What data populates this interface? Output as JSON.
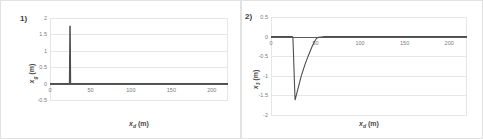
{
  "figure": {
    "panel_count": 2,
    "background": "#ffffff",
    "border_color": "#e2e2e2",
    "series_color": "#4d4d4d",
    "grid_color": "#e6e6e6"
  },
  "panels": [
    {
      "label": "1)",
      "name": "panel-1"
    },
    {
      "label": "2)",
      "name": "panel-2"
    }
  ],
  "chart_data": [
    {
      "type": "line",
      "title": "",
      "panel_label": "1)",
      "xlabel_var": "x",
      "xlabel_sub": "d",
      "xlabel_unit": "(m)",
      "ylabel_var": "x",
      "ylabel_sub": "g",
      "ylabel_unit": "(m)",
      "xlim": [
        0,
        220
      ],
      "ylim": [
        -0.5,
        2
      ],
      "xticks": [
        0,
        50,
        100,
        150,
        200
      ],
      "xticklabels": [
        "0",
        "50",
        "100",
        "150",
        "200"
      ],
      "yticks": [
        -0.5,
        0,
        0.5,
        1,
        1.5,
        2
      ],
      "yticklabels": [
        "-0.5",
        "0",
        "0.5",
        "1",
        "1.5",
        "2"
      ],
      "grid": true,
      "legend": "none",
      "x": [
        0,
        10,
        20,
        24,
        24.5,
        25,
        25.5,
        26,
        30,
        40,
        60,
        90,
        120,
        150,
        180,
        210,
        220
      ],
      "values": [
        0,
        0,
        0,
        0,
        1.75,
        1.75,
        0,
        0,
        0,
        0,
        0,
        0,
        0,
        0,
        0,
        0,
        0
      ]
    },
    {
      "type": "line",
      "title": "",
      "panel_label": "2)",
      "xlabel_var": "x",
      "xlabel_sub": "d",
      "xlabel_unit": "(m)",
      "ylabel_var": "x",
      "ylabel_sub": "3",
      "ylabel_unit": "(m)",
      "xlim": [
        0,
        220
      ],
      "ylim": [
        -2,
        0.5
      ],
      "xticks": [
        0,
        50,
        100,
        150,
        200
      ],
      "xticklabels": [
        "0",
        "50",
        "100",
        "150",
        "200"
      ],
      "yticks": [
        -2,
        -1.5,
        -1,
        -0.5,
        0,
        0.5
      ],
      "yticklabels": [
        "-2",
        "-1.5",
        "-1",
        "-0.5",
        "0",
        "0.5"
      ],
      "grid": true,
      "legend": "none",
      "x": [
        0,
        10,
        20,
        24,
        24.6,
        27,
        30,
        34,
        38,
        42,
        46,
        49,
        51,
        53,
        56,
        60,
        70,
        90,
        120,
        150,
        180,
        210,
        220
      ],
      "values": [
        0,
        0,
        0,
        0,
        -0.02,
        -1.62,
        -1.35,
        -1.0,
        -0.72,
        -0.48,
        -0.26,
        -0.12,
        -0.05,
        -0.02,
        -0.01,
        0,
        0,
        0,
        0,
        0,
        0,
        0,
        0
      ]
    }
  ]
}
